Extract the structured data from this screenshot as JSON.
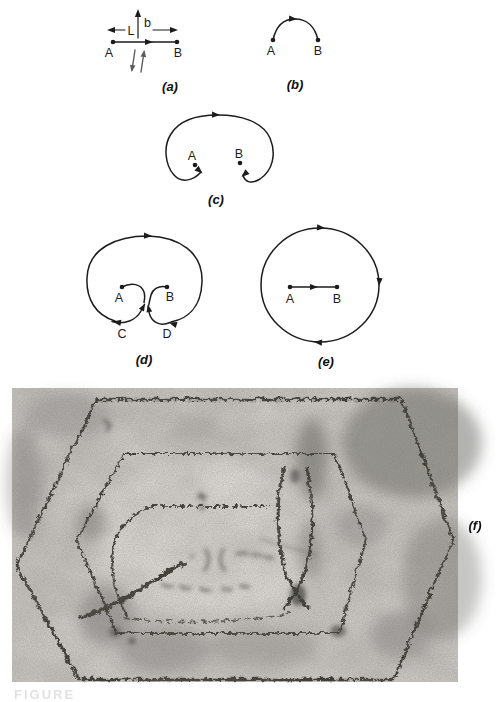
{
  "colors": {
    "ink": "#1c1c1c",
    "paper": "#ffffff",
    "micrograph_base": "#d8d5d0",
    "micrograph_line": "#35322c"
  },
  "panels": {
    "a": {
      "label": "(a)",
      "point_a": "A",
      "point_b": "B",
      "length_symbol": "L",
      "burgers_symbol": "b"
    },
    "b": {
      "label": "(b)",
      "point_a": "A",
      "point_b": "B"
    },
    "c": {
      "label": "(c)",
      "point_a": "A",
      "point_b": "B"
    },
    "d": {
      "label": "(d)",
      "point_a": "A",
      "point_b": "B",
      "arrow_c": "C",
      "arrow_d": "D"
    },
    "e": {
      "label": "(e)",
      "point_a": "A",
      "point_b": "B"
    },
    "f": {
      "label": "(f)"
    }
  },
  "caption_fragment": "FIGURE"
}
